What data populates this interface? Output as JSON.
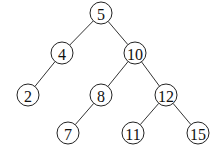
{
  "diagram": {
    "type": "binary-tree",
    "radius": 11,
    "nodes": [
      {
        "id": "n5",
        "label": "5",
        "x": 101,
        "y": 13
      },
      {
        "id": "n4",
        "label": "4",
        "x": 62,
        "y": 53
      },
      {
        "id": "n10",
        "label": "10",
        "x": 135,
        "y": 53
      },
      {
        "id": "n2",
        "label": "2",
        "x": 28,
        "y": 95
      },
      {
        "id": "n8",
        "label": "8",
        "x": 101,
        "y": 95
      },
      {
        "id": "n12",
        "label": "12",
        "x": 166,
        "y": 95
      },
      {
        "id": "n7",
        "label": "7",
        "x": 68,
        "y": 133
      },
      {
        "id": "n11",
        "label": "11",
        "x": 133,
        "y": 133
      },
      {
        "id": "n15",
        "label": "15",
        "x": 198,
        "y": 133
      }
    ],
    "edges": [
      [
        "n5",
        "n4"
      ],
      [
        "n5",
        "n10"
      ],
      [
        "n4",
        "n2"
      ],
      [
        "n10",
        "n8"
      ],
      [
        "n10",
        "n12"
      ],
      [
        "n8",
        "n7"
      ],
      [
        "n12",
        "n11"
      ],
      [
        "n12",
        "n15"
      ]
    ]
  }
}
